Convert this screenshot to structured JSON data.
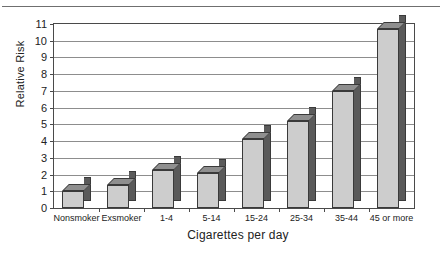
{
  "chart_data": {
    "type": "bar",
    "title": "",
    "xlabel": "Cigarettes per day",
    "ylabel": "Relative Risk",
    "categories": [
      "Nonsmoker",
      "Exsmoker",
      "1-4",
      "5-14",
      "15-24",
      "25-34",
      "35-44",
      "45 or more"
    ],
    "values": [
      1.0,
      1.4,
      2.3,
      2.1,
      4.1,
      5.2,
      7.0,
      10.7
    ],
    "ylim": [
      0,
      11
    ],
    "ytick_labels": [
      "0",
      "1",
      "2",
      "3",
      "4",
      "5",
      "6",
      "7",
      "8",
      "9",
      "10",
      "11"
    ],
    "ytick_values": [
      0,
      1,
      2,
      3,
      4,
      5,
      6,
      7,
      8,
      9,
      10,
      11
    ],
    "grid": true,
    "legend": "none",
    "style": "3d-bar-grayscale",
    "colors": {
      "bar_front": "#cdcdcd",
      "bar_side": "#5a5a5a",
      "bar_top": "#8f8f8f",
      "bar_outline": "#3a3a3a",
      "gridline": "#8d8d8d",
      "axis": "#4a4a4a",
      "text": "#222222",
      "background": "#ffffff",
      "top_rule": "#6f6f6f"
    }
  }
}
